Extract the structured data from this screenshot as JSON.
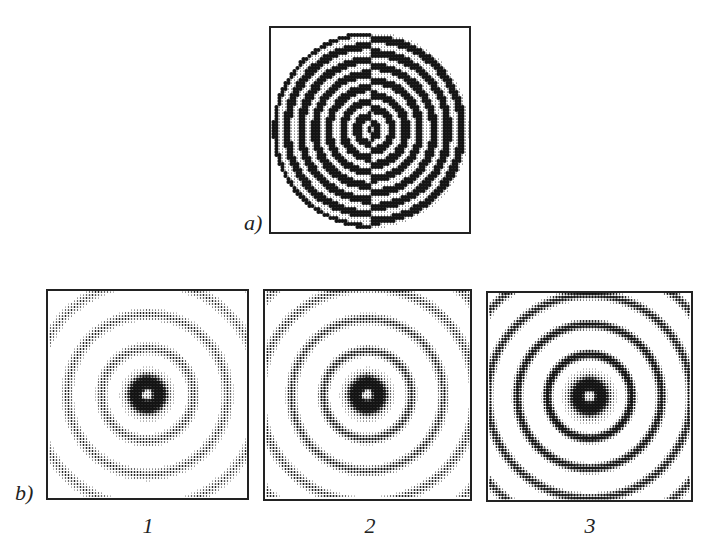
{
  "figure": {
    "panel_a": {
      "label": "a)",
      "description": "Binary phase zone plate: concentric rings, left half and right half phase-inverted",
      "ring_period_px": 14,
      "num_rings_visible": 7
    },
    "panel_b": {
      "label": "b)",
      "subpanels": [
        {
          "label": "1",
          "contrast": 0.45,
          "ring_period_px": 34,
          "center_strength": 1.0
        },
        {
          "label": "2",
          "contrast": 0.6,
          "ring_period_px": 32,
          "center_strength": 1.0
        },
        {
          "label": "3",
          "contrast": 0.95,
          "ring_period_px": 30,
          "center_strength": 1.0
        }
      ]
    },
    "colors": {
      "ink": "#1a1a1a",
      "paper": "#ffffff",
      "frame": "#222222"
    }
  }
}
